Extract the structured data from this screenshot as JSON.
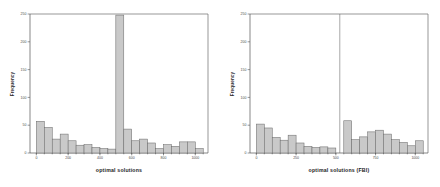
{
  "figure": {
    "background": "#ffffff",
    "bar_fill": "#c9c9c9",
    "bar_stroke": "#6e6e6e",
    "axis_color": "#555555"
  },
  "chart_data": [
    {
      "type": "bar",
      "title": "",
      "xlabel": "optimal solutions",
      "ylabel": "Frequency",
      "xlim": [
        -40,
        1080
      ],
      "ylim": [
        0,
        250
      ],
      "xticks": [
        0,
        200,
        400,
        600,
        800,
        1000
      ],
      "xticklabels": [
        "0",
        "200",
        "400",
        "600",
        "800",
        "1000"
      ],
      "yticks": [
        0,
        50,
        100,
        150,
        200,
        250
      ],
      "yticklabels": [
        "0",
        "50",
        "100",
        "150",
        "200",
        "250"
      ],
      "grid": false,
      "legend": "none",
      "bin_width": 50,
      "bin_edges": [
        0,
        50,
        100,
        150,
        200,
        250,
        300,
        350,
        400,
        450,
        500,
        550,
        600,
        650,
        700,
        750,
        800,
        850,
        900,
        950,
        1000,
        1050
      ],
      "categories": [
        "0-50",
        "50-100",
        "100-150",
        "150-200",
        "200-250",
        "250-300",
        "300-350",
        "350-400",
        "400-450",
        "450-500",
        "500-550",
        "550-600",
        "600-650",
        "650-700",
        "700-750",
        "750-800",
        "800-850",
        "850-900",
        "900-950",
        "950-1000",
        "1000-1050"
      ],
      "values": [
        57,
        46,
        25,
        34,
        22,
        14,
        15,
        10,
        8,
        7,
        248,
        43,
        22,
        25,
        18,
        8,
        15,
        12,
        20,
        20,
        8
      ],
      "annotations": [
        {
          "type": "spike",
          "note": "bar at bin 500-550 extends to top of axes"
        }
      ]
    },
    {
      "type": "bar",
      "title": "",
      "xlabel": "optimal solutions (FBI)",
      "ylabel": "Frequency",
      "xlim": [
        -40,
        1080
      ],
      "ylim": [
        0,
        250
      ],
      "xticks": [
        0,
        250,
        500,
        750,
        1000
      ],
      "xticklabels": [
        "0",
        "250",
        "500",
        "750",
        "1000"
      ],
      "yticks": [
        0,
        50,
        100,
        150,
        200,
        250
      ],
      "yticklabels": [
        "0",
        "50",
        "100",
        "150",
        "200",
        "250"
      ],
      "grid": false,
      "legend": "none",
      "bin_width": 50,
      "bin_edges": [
        0,
        50,
        100,
        150,
        200,
        250,
        300,
        350,
        400,
        450,
        500,
        550,
        600,
        650,
        700,
        750,
        800,
        850,
        900,
        950,
        1000,
        1050
      ],
      "categories": [
        "0-50",
        "50-100",
        "100-150",
        "150-200",
        "200-250",
        "250-300",
        "300-350",
        "350-400",
        "400-450",
        "450-500",
        "500-550",
        "550-600",
        "600-650",
        "650-700",
        "700-750",
        "750-800",
        "800-850",
        "850-900",
        "900-950",
        "950-1000",
        "1000-1050"
      ],
      "values": [
        52,
        45,
        28,
        23,
        32,
        18,
        12,
        10,
        11,
        9,
        250,
        58,
        24,
        29,
        38,
        41,
        34,
        24,
        19,
        13,
        22
      ],
      "annotations": [
        {
          "type": "spike",
          "note": "narrow spike at 500 extends to top of axes"
        },
        {
          "type": "tall-last",
          "note": "final bar at 1000-1050 is notably tall"
        }
      ]
    }
  ],
  "panels": [
    {
      "name": "left-panel",
      "xlabel": "optimal solutions",
      "ylabel": "Frequency"
    },
    {
      "name": "right-panel",
      "xlabel": "optimal solutions (FBI)",
      "ylabel": "Frequency"
    }
  ]
}
